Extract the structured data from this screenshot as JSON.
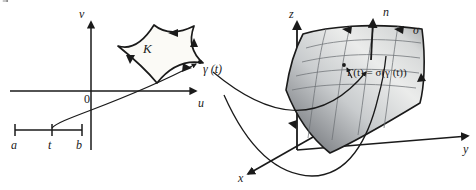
{
  "figure": {
    "title_alt": "Parametrized surface diagram",
    "background_color": "#ffffff",
    "ink_color": "#1a1a1a"
  },
  "domain_plot": {
    "axis_v_label": "v",
    "axis_u_label": "u",
    "origin_label": "0",
    "region_label": "K",
    "curve_point_label": "γ (t)"
  },
  "interval": {
    "left_endpoint_label": "a",
    "parameter_label": "t",
    "right_endpoint_label": "b"
  },
  "space_plot": {
    "axis_z_label": "z",
    "axis_x_label": "x",
    "axis_y_label": "y",
    "normal_label": "n",
    "surface_label": "σ",
    "image_curve_label": "Γ(t) = σ(γ (t))"
  },
  "colors": {
    "surface_dark": "#6f7276",
    "surface_mid": "#b9bcbf",
    "surface_light": "#f4f4f2",
    "region_fill": "#fbfaf6",
    "stroke": "#1a1a1a"
  }
}
